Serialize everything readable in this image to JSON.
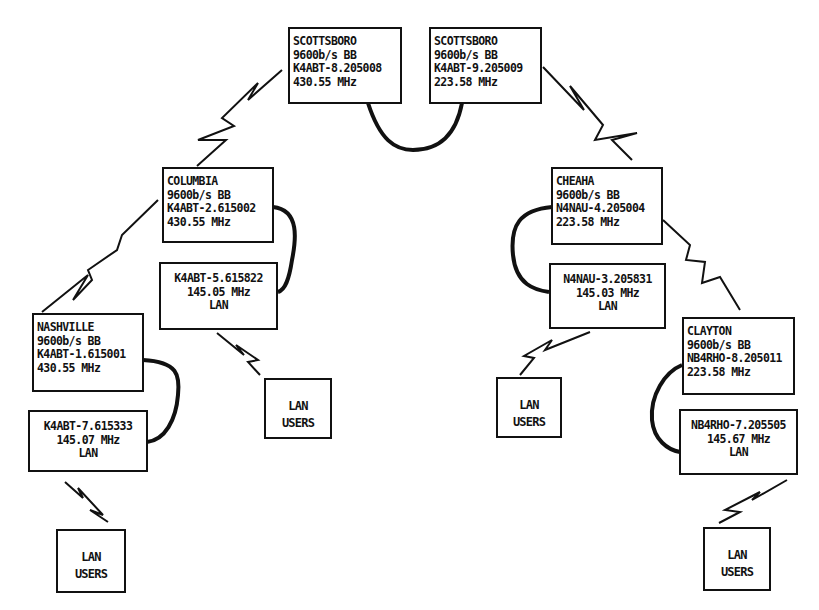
{
  "diagram": {
    "type": "packet radio network diagram",
    "stations": [
      {
        "id": "scottsboro-1",
        "name": "SCOTTSBORO",
        "rate": "9600b/s BB",
        "callsign": "K4ABT-8.205008",
        "frequency": "430.55 MHz"
      },
      {
        "id": "scottsboro-2",
        "name": "SCOTTSBORO",
        "rate": "9600b/s BB",
        "callsign": "K4ABT-9.205009",
        "frequency": "223.58 MHz"
      },
      {
        "id": "columbia",
        "name": "COLUMBIA",
        "rate": "9600b/s BB",
        "callsign": "K4ABT-2.615002",
        "frequency": "430.55 MHz"
      },
      {
        "id": "cheaha",
        "name": "CHEAHA",
        "rate": "9600b/s BB",
        "callsign": "N4NAU-4.205004",
        "frequency": "223.58 MHz"
      },
      {
        "id": "nashville",
        "name": "NASHVILLE",
        "rate": "9600b/s BB",
        "callsign": "K4ABT-1.615001",
        "frequency": "430.55 MHz"
      },
      {
        "id": "clayton",
        "name": "CLAYTON",
        "rate": "9600b/s BB",
        "callsign": "NB4RHO-8.205011",
        "frequency": "223.58 MHz"
      }
    ],
    "lan_nodes": [
      {
        "id": "columbia-lan",
        "callsign": "K4ABT-5.615822",
        "frequency": "145.05 MHz",
        "label": "LAN"
      },
      {
        "id": "cheaha-lan",
        "callsign": "N4NAU-3.205831",
        "frequency": "145.03 MHz",
        "label": "LAN"
      },
      {
        "id": "nashville-lan",
        "callsign": "K4ABT-7.615333",
        "frequency": "145.07 MHz",
        "label": "LAN"
      },
      {
        "id": "clayton-lan",
        "callsign": "NB4RHO-7.205505",
        "frequency": "145.67 MHz",
        "label": "LAN"
      }
    ],
    "lan_users": {
      "line1": "LAN",
      "line2": "USERS"
    },
    "colors": {
      "ink": "#111111",
      "background": "#ffffff"
    }
  }
}
